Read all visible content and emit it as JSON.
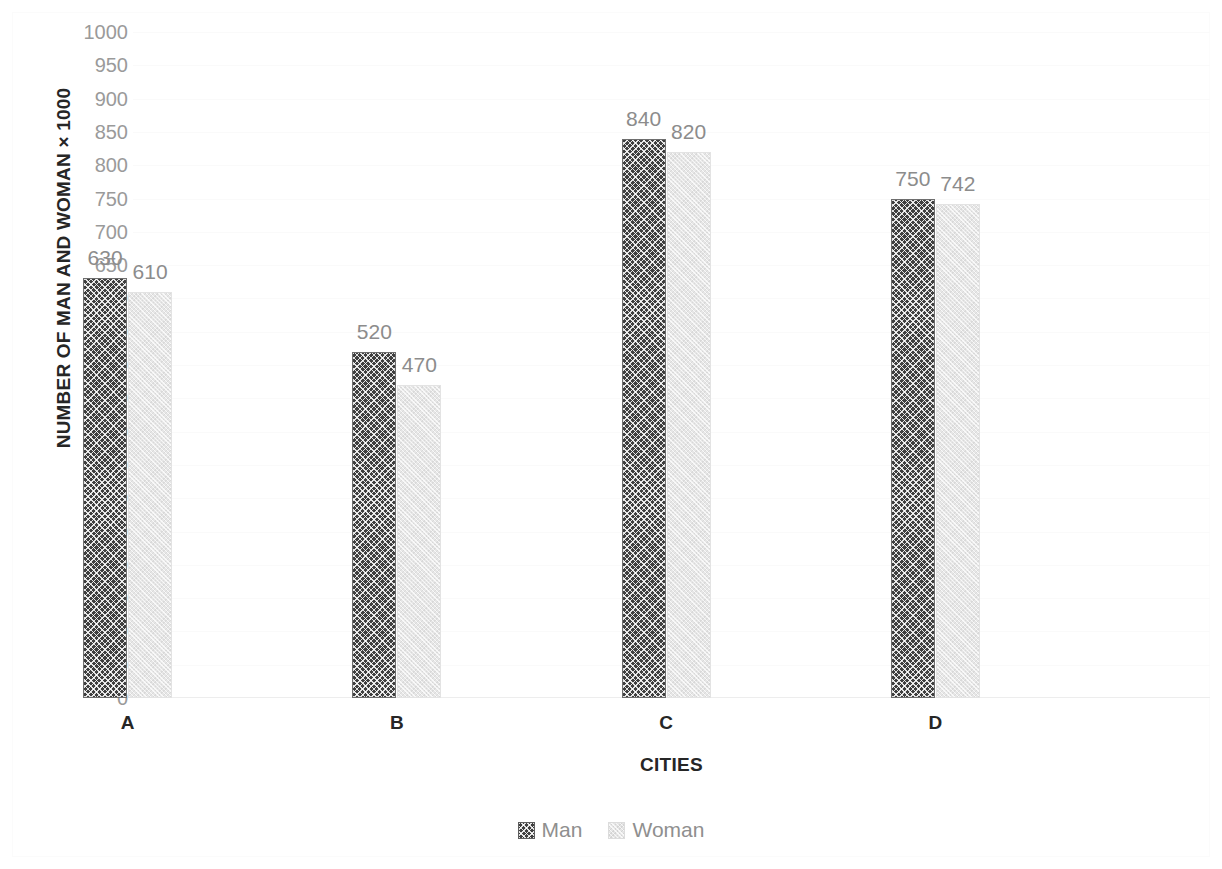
{
  "chart_data": {
    "type": "bar",
    "title": "",
    "subtitle": "",
    "xlabel": "CITIES",
    "ylabel": "NUMBER OF MAN AND WOMAN × 1000",
    "categories": [
      "A",
      "B",
      "C",
      "D"
    ],
    "series": [
      {
        "name": "Man",
        "values": [
          630,
          520,
          840,
          750
        ],
        "color": "#3f3f3f",
        "pattern": "cross-hatch"
      },
      {
        "name": "Woman",
        "values": [
          610,
          470,
          820,
          742
        ],
        "color": "#e6e6e6",
        "pattern": "light-speckle"
      }
    ],
    "ylim": [
      0,
      1000
    ],
    "ytick_step": 50,
    "yticks": [
      0,
      50,
      100,
      150,
      200,
      250,
      300,
      350,
      400,
      450,
      500,
      550,
      600,
      650,
      700,
      750,
      800,
      850,
      900,
      950,
      1000
    ],
    "ytick_labels": [
      "0",
      "50",
      "100",
      "150",
      "200",
      "250",
      "300",
      "350",
      "400",
      "450",
      "500",
      "550",
      "600",
      "650",
      "700",
      "750",
      "800",
      "850",
      "900",
      "950",
      "1000"
    ],
    "data_labels": true,
    "data_label_color": "#8c8c8c",
    "grid": true,
    "grid_color": "#fafafa",
    "legend_position": "bottom",
    "legend_entries": [
      "Man",
      "Woman"
    ],
    "background_color": "#ffffff",
    "axis_text_color": "#262626",
    "tick_label_color": "#9a9a9a"
  },
  "legend": {
    "items": [
      {
        "label": "Man"
      },
      {
        "label": "Woman"
      }
    ]
  }
}
